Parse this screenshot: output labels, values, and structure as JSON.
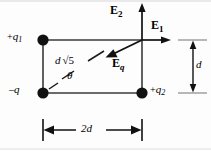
{
  "figure": {
    "type": "physics-diagram",
    "background_color": "#fdfdfd",
    "ink_color": "#000000",
    "width": 211,
    "height": 151
  },
  "charges": [
    {
      "id": "q1",
      "label": "+q",
      "subscript": "1",
      "sign": "+",
      "position": "top-left",
      "x": 43,
      "y": 40,
      "label_x": 8,
      "label_y": 33
    },
    {
      "id": "q",
      "label": "–q",
      "subscript": "",
      "sign": "–",
      "position": "bottom-left",
      "x": 43,
      "y": 93,
      "label_x": 10,
      "label_y": 86
    },
    {
      "id": "q2",
      "label": "+q",
      "subscript": "2",
      "sign": "+",
      "position": "bottom-right",
      "x": 142,
      "y": 93,
      "label_x": 150,
      "label_y": 86
    }
  ],
  "field_point": {
    "name": "field-point",
    "x": 142,
    "y": 40,
    "description": "top-right corner where field vectors originate"
  },
  "vectors": [
    {
      "id": "E1",
      "label": "E",
      "subscript": "1",
      "direction": "right",
      "from_x": 142,
      "from_y": 40,
      "to_x": 170,
      "to_y": 40,
      "label_x": 152,
      "label_y": 21
    },
    {
      "id": "E2",
      "label": "E",
      "subscript": "2",
      "direction": "up",
      "from_x": 142,
      "from_y": 40,
      "to_x": 142,
      "to_y": 5,
      "label_x": 112,
      "label_y": 6
    },
    {
      "id": "Eq",
      "label": "E",
      "subscript": "q",
      "direction": "down-left",
      "from_x": 142,
      "from_y": 40,
      "to_x": 107,
      "to_y": 57,
      "label_x": 113,
      "label_y": 59
    }
  ],
  "dimensions": [
    {
      "id": "height",
      "label": "d",
      "orientation": "vertical",
      "line_x": 193,
      "from_y": 40,
      "to_y": 93,
      "label_x": 196,
      "label_y": 60
    },
    {
      "id": "width",
      "label": "2d",
      "orientation": "horizontal",
      "line_y": 130,
      "from_x": 43,
      "to_x": 142,
      "label_x": 82,
      "label_y": 122
    }
  ],
  "diagonal": {
    "id": "diagonal-length",
    "label_prefix": "d",
    "label_radical": "√5",
    "label_x": 56,
    "label_y": 57,
    "from_x": 43,
    "from_y": 93,
    "to_x": 142,
    "to_y": 40,
    "style": "dashed"
  },
  "angle": {
    "id": "theta",
    "label": "θ",
    "label_x": 68,
    "label_y": 73
  }
}
